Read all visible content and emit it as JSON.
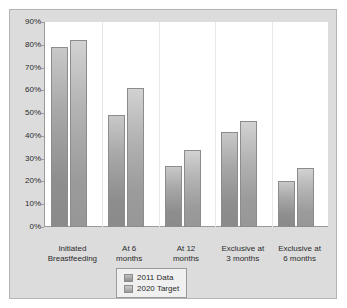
{
  "chart_data": {
    "type": "bar",
    "title": "",
    "xlabel": "",
    "ylabel": "",
    "ylim": [
      0,
      90
    ],
    "grid": false,
    "legend_position": "bottom-center",
    "ytick_labels": [
      "90%",
      "80%",
      "70%",
      "60%",
      "50%",
      "40%",
      "30%",
      "20%",
      "10%",
      "0%"
    ],
    "ytick_values": [
      90,
      80,
      70,
      60,
      50,
      40,
      30,
      20,
      10,
      0
    ],
    "categories": [
      "Initiated\nBreastfeeding",
      "At 6\nmonths",
      "At 12\nmonths",
      "Exclusive at\n3 months",
      "Exclusive at\n6 months"
    ],
    "category_lines": [
      [
        "Initiated",
        "Breastfeeding"
      ],
      [
        "At 6",
        "months"
      ],
      [
        "At 12",
        "months"
      ],
      [
        "Exclusive at",
        "3 months"
      ],
      [
        "Exclusive at",
        "6 months"
      ]
    ],
    "series": [
      {
        "name": "2011 Data",
        "color": "#9a9a9a",
        "values": [
          79,
          49,
          27,
          41.5,
          20
        ]
      },
      {
        "name": "2020 Target",
        "color": "#a8a8a8",
        "values": [
          82,
          61,
          34,
          46.5,
          26
        ]
      }
    ]
  },
  "legend": {
    "items": [
      {
        "label": "2011 Data"
      },
      {
        "label": "2020 Target"
      }
    ]
  }
}
